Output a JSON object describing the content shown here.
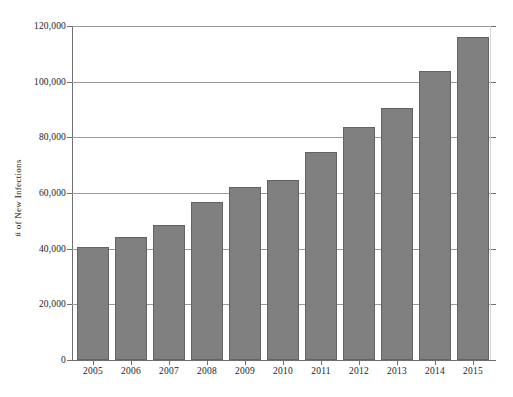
{
  "chart_data": {
    "type": "bar",
    "title": "",
    "subtitle": "",
    "xlabel": "",
    "ylabel": "# of New Infections",
    "categories": [
      "2005",
      "2006",
      "2007",
      "2008",
      "2009",
      "2010",
      "2011",
      "2012",
      "2013",
      "2014",
      "2015"
    ],
    "values": [
      40600,
      44300,
      48500,
      56800,
      62100,
      64700,
      74900,
      83700,
      90700,
      103700,
      116000
    ],
    "series": [
      {
        "name": "# of New Infections",
        "values": [
          40600,
          44300,
          48500,
          56800,
          62100,
          64700,
          74900,
          83700,
          90700,
          103700,
          116000
        ]
      }
    ],
    "ylim": [
      0,
      120000
    ],
    "yticks": [
      0,
      20000,
      40000,
      60000,
      80000,
      100000,
      120000
    ],
    "ytick_labels": [
      "0",
      "20,000",
      "40,000",
      "60,000",
      "80,000",
      "100,000",
      "120,000"
    ],
    "grid": "horizontal",
    "legend": "none",
    "bar_color": "#808080",
    "bar_edge_color": "#636363",
    "gridline_color": "#9a9a9a",
    "background_color": "#ffffff",
    "annotations": []
  }
}
